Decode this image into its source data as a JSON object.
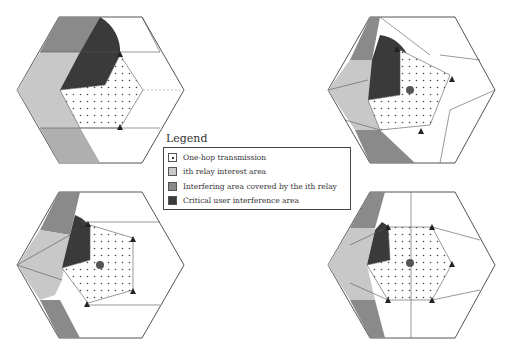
{
  "legend": {
    "title": "Legend",
    "items": [
      {
        "label": "One-hop transmission",
        "swatch": "#ffffff",
        "dotted": true
      },
      {
        "label": "ith relay interest area",
        "swatch": "#c8c8c8",
        "dotted": false
      },
      {
        "label": "Interfering area covered by the ith relay",
        "swatch": "#8a8a8a",
        "dotted": false
      },
      {
        "label": "Critical user interference area",
        "swatch": "#3a3a3a",
        "dotted": false
      }
    ]
  },
  "colors": {
    "outline": "#555555",
    "light_gray": "#c8c8c8",
    "mid_gray": "#8a8a8a",
    "dark_gray": "#3a3a3a",
    "dot": "#444444",
    "relay": "#222222"
  },
  "panels": [
    {
      "id": "top-left",
      "relays": 3
    },
    {
      "id": "top-right",
      "relays": 4
    },
    {
      "id": "bottom-left",
      "relays": 5
    },
    {
      "id": "bottom-right",
      "relays": 6
    }
  ]
}
